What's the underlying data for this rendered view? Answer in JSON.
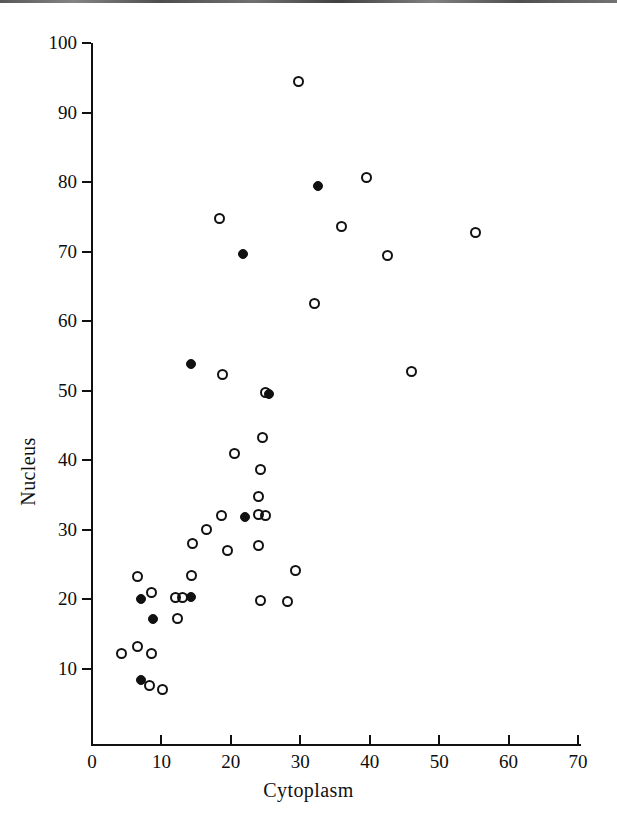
{
  "chart_data": {
    "type": "scatter",
    "title": "",
    "xlabel": "Cytoplasm",
    "ylabel": "Nucleus",
    "xlim": [
      0,
      70
    ],
    "ylim": [
      0,
      100
    ],
    "xticks": [
      0,
      10,
      20,
      30,
      40,
      50,
      60,
      70
    ],
    "yticks": [
      10,
      20,
      30,
      40,
      50,
      60,
      70,
      80,
      90,
      100
    ],
    "xtick_labels": [
      "0",
      "10",
      "20",
      "30",
      "40",
      "50",
      "60",
      "70"
    ],
    "ytick_labels": [
      "10",
      "20",
      "30",
      "40",
      "50",
      "60",
      "70",
      "80",
      "90",
      "100"
    ],
    "grid": false,
    "legend": "none",
    "marker_color": "#111111",
    "series": [
      {
        "name": "open-circles",
        "marker": "open-circle",
        "points": [
          [
            29.8,
            94.5
          ],
          [
            39.5,
            80.7
          ],
          [
            18.3,
            74.8
          ],
          [
            36.0,
            73.6
          ],
          [
            55.3,
            72.7
          ],
          [
            42.5,
            69.5
          ],
          [
            32.0,
            62.5
          ],
          [
            46.0,
            52.7
          ],
          [
            18.8,
            52.3
          ],
          [
            25.0,
            49.8
          ],
          [
            24.5,
            43.3
          ],
          [
            20.5,
            41.0
          ],
          [
            24.3,
            38.7
          ],
          [
            24.0,
            34.8
          ],
          [
            18.7,
            32.0
          ],
          [
            25.0,
            32.0
          ],
          [
            24.0,
            32.2
          ],
          [
            16.5,
            30.0
          ],
          [
            14.5,
            28.0
          ],
          [
            19.5,
            27.0
          ],
          [
            24.0,
            27.8
          ],
          [
            29.3,
            24.1
          ],
          [
            6.5,
            23.3
          ],
          [
            14.3,
            23.5
          ],
          [
            8.5,
            21.0
          ],
          [
            12.0,
            20.3
          ],
          [
            13.0,
            20.3
          ],
          [
            24.2,
            19.8
          ],
          [
            28.2,
            19.7
          ],
          [
            12.3,
            17.2
          ],
          [
            6.5,
            13.3
          ],
          [
            4.2,
            12.3
          ],
          [
            8.5,
            12.2
          ],
          [
            8.3,
            7.6
          ],
          [
            10.2,
            7.1
          ]
        ]
      },
      {
        "name": "filled-circles",
        "marker": "filled-circle",
        "points": [
          [
            32.5,
            79.4
          ],
          [
            21.8,
            69.7
          ],
          [
            14.3,
            53.8
          ],
          [
            25.5,
            49.6
          ],
          [
            22.0,
            31.8
          ],
          [
            14.2,
            20.3
          ],
          [
            7.0,
            20.1
          ],
          [
            8.8,
            17.2
          ],
          [
            7.0,
            8.4
          ]
        ]
      }
    ]
  },
  "axes": {
    "x_title": "Cytoplasm",
    "y_title": "Nucleus"
  }
}
